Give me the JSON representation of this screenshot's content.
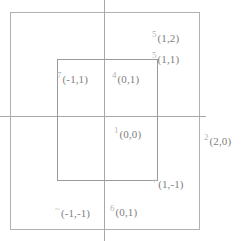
{
  "figure": {
    "type": "coordinate-grid-diagram",
    "background_color": "#ffffff",
    "line_color": "#a8a8a8",
    "text_color": "#8d8d8d"
  },
  "shapes": {
    "outer_rectangle": {
      "name": "outer-rectangle",
      "x": 10,
      "y": 12,
      "width": 190,
      "height": 218
    },
    "inner_rectangle": {
      "name": "inner-rectangle",
      "x": 57,
      "y": 59,
      "width": 101,
      "height": 122
    },
    "vertical_axis": {
      "name": "vertical-axis",
      "x": 104
    },
    "horizontal_axis": {
      "name": "horizontal-axis",
      "y": 116
    }
  },
  "labels": [
    {
      "id": "p1_2",
      "marker": "5",
      "coord": "(1,2)",
      "x": 1,
      "y": 2
    },
    {
      "id": "p1_1",
      "marker": "5",
      "coord": "(1,1)",
      "x": 1,
      "y": 1
    },
    {
      "id": "pm1_1",
      "marker": "7",
      "coord": "(-1,1)",
      "x": -1,
      "y": 1
    },
    {
      "id": "p0_1t",
      "marker": "4",
      "coord": "(0,1)",
      "x": 0,
      "y": 1
    },
    {
      "id": "p0_0",
      "marker": "1",
      "coord": "(0,0)",
      "x": 0,
      "y": 0
    },
    {
      "id": "p2_0",
      "marker": "2",
      "coord": "(2,0)",
      "x": 2,
      "y": 0
    },
    {
      "id": "p1_m1",
      "marker": "+",
      "coord": "(1,-1)",
      "x": 1,
      "y": -1
    },
    {
      "id": "pm1_m1",
      "marker": "~",
      "coord": "(-1,-1)",
      "x": -1,
      "y": -1
    },
    {
      "id": "p0_1b",
      "marker": "6",
      "coord": "(0,1)",
      "x": 0,
      "y": 1
    }
  ]
}
